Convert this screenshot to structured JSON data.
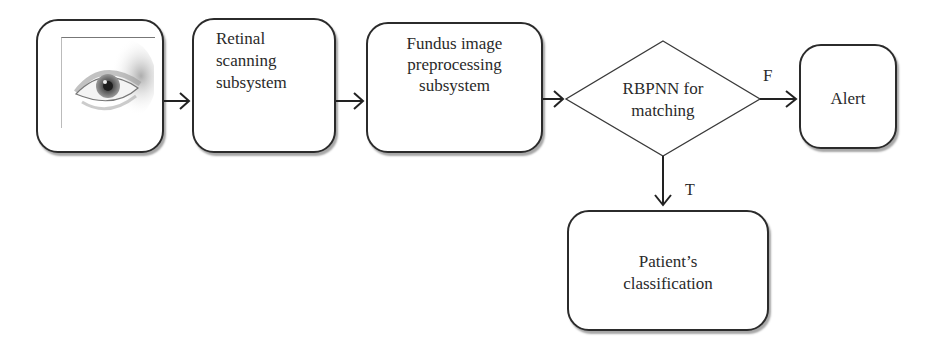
{
  "diagram": {
    "nodes": {
      "input_image": {
        "label": "",
        "icon": "eye-icon"
      },
      "retinal": {
        "line1": "Retinal",
        "line2": "scanning",
        "line3": "subsystem"
      },
      "fundus": {
        "line1": "Fundus image",
        "line2": "preprocessing",
        "line3": "subsystem"
      },
      "decision": {
        "line1": "RBPNN for",
        "line2": "matching"
      },
      "alert": {
        "label": "Alert"
      },
      "patient": {
        "line1": "Patient’s",
        "line2": "classification"
      }
    },
    "edges": [
      {
        "from": "input_image",
        "to": "retinal",
        "label": ""
      },
      {
        "from": "retinal",
        "to": "fundus",
        "label": ""
      },
      {
        "from": "fundus",
        "to": "decision",
        "label": ""
      },
      {
        "from": "decision",
        "to": "alert",
        "label": "F"
      },
      {
        "from": "decision",
        "to": "patient",
        "label": "T"
      }
    ],
    "edge_labels": {
      "false": "F",
      "true": "T"
    }
  }
}
